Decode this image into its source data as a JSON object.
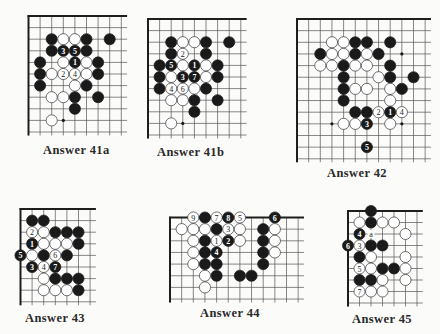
{
  "colors": {
    "background": "#fbfbf9",
    "line": "#555555",
    "edge": "#1e1e1e",
    "black_stone": "#1a1a1a",
    "white_stone": "#ffffff",
    "text": "#2a2a2a"
  },
  "boards": [
    {
      "id": "41a",
      "caption": "Answer 41a",
      "origin": [
        28.5,
        16
      ],
      "spacing": 11.6,
      "cols": 9,
      "rows": 11,
      "edges": {
        "left": true,
        "top": true
      },
      "caption_pos": [
        43,
        143
      ],
      "stones": [
        {
          "c": 2,
          "r": 2,
          "color": "B"
        },
        {
          "c": 3,
          "r": 2,
          "color": "W"
        },
        {
          "c": 4,
          "r": 2,
          "color": "W"
        },
        {
          "c": 5,
          "r": 2,
          "color": "B"
        },
        {
          "c": 7,
          "r": 2,
          "color": "B"
        },
        {
          "c": 2,
          "r": 3,
          "color": "B"
        },
        {
          "c": 3,
          "r": 3,
          "color": "B",
          "label": "3"
        },
        {
          "c": 4,
          "r": 3,
          "color": "B",
          "label": "5"
        },
        {
          "c": 5,
          "r": 3,
          "color": "B"
        },
        {
          "c": 1,
          "r": 4,
          "color": "B"
        },
        {
          "c": 3,
          "r": 4,
          "color": "W"
        },
        {
          "c": 4,
          "r": 4,
          "color": "B",
          "label": "1"
        },
        {
          "c": 5,
          "r": 4,
          "color": "W"
        },
        {
          "c": 6,
          "r": 4,
          "color": "B"
        },
        {
          "c": 1,
          "r": 5,
          "color": "B"
        },
        {
          "c": 2,
          "r": 5,
          "color": "W"
        },
        {
          "c": 3,
          "r": 5,
          "color": "W",
          "label": "2"
        },
        {
          "c": 4,
          "r": 5,
          "color": "W",
          "label": "4"
        },
        {
          "c": 5,
          "r": 5,
          "color": "W"
        },
        {
          "c": 6,
          "r": 5,
          "color": "B"
        },
        {
          "c": 1,
          "r": 6,
          "color": "B"
        },
        {
          "c": 4,
          "r": 6,
          "color": "W"
        },
        {
          "c": 5,
          "r": 6,
          "color": "B"
        },
        {
          "c": 2,
          "r": 7,
          "color": "W"
        },
        {
          "c": 3,
          "r": 7,
          "color": "W"
        },
        {
          "c": 4,
          "r": 7,
          "color": "B"
        },
        {
          "c": 6,
          "r": 7,
          "color": "B"
        },
        {
          "c": 4,
          "r": 8,
          "color": "B"
        },
        {
          "c": 2,
          "r": 9,
          "color": "W"
        }
      ],
      "hoshi": [
        {
          "c": 3,
          "r": 9
        }
      ]
    },
    {
      "id": "41b",
      "caption": "Answer 41b",
      "origin": [
        148,
        19
      ],
      "spacing": 11.6,
      "cols": 9,
      "rows": 11,
      "edges": {
        "left": true,
        "top": true
      },
      "caption_pos": [
        157,
        145
      ],
      "stones": [
        {
          "c": 2,
          "r": 2,
          "color": "B"
        },
        {
          "c": 3,
          "r": 2,
          "color": "W"
        },
        {
          "c": 4,
          "r": 2,
          "color": "W"
        },
        {
          "c": 5,
          "r": 2,
          "color": "B"
        },
        {
          "c": 7,
          "r": 2,
          "color": "B"
        },
        {
          "c": 2,
          "r": 3,
          "color": "B"
        },
        {
          "c": 3,
          "r": 3,
          "color": "W",
          "label": "2"
        },
        {
          "c": 5,
          "r": 3,
          "color": "B"
        },
        {
          "c": 1,
          "r": 4,
          "color": "B"
        },
        {
          "c": 2,
          "r": 4,
          "color": "B",
          "label": "5"
        },
        {
          "c": 3,
          "r": 4,
          "color": "W"
        },
        {
          "c": 4,
          "r": 4,
          "color": "B",
          "label": "1"
        },
        {
          "c": 5,
          "r": 4,
          "color": "W"
        },
        {
          "c": 6,
          "r": 4,
          "color": "B"
        },
        {
          "c": 1,
          "r": 5,
          "color": "B"
        },
        {
          "c": 2,
          "r": 5,
          "color": "W"
        },
        {
          "c": 3,
          "r": 5,
          "color": "B",
          "label": "3"
        },
        {
          "c": 4,
          "r": 5,
          "color": "B",
          "label": "7"
        },
        {
          "c": 5,
          "r": 5,
          "color": "W"
        },
        {
          "c": 6,
          "r": 5,
          "color": "B"
        },
        {
          "c": 1,
          "r": 6,
          "color": "B"
        },
        {
          "c": 2,
          "r": 6,
          "color": "W",
          "label": "4"
        },
        {
          "c": 3,
          "r": 6,
          "color": "W",
          "label": "6"
        },
        {
          "c": 4,
          "r": 6,
          "color": "W"
        },
        {
          "c": 5,
          "r": 6,
          "color": "B"
        },
        {
          "c": 2,
          "r": 7,
          "color": "W"
        },
        {
          "c": 3,
          "r": 7,
          "color": "W"
        },
        {
          "c": 4,
          "r": 7,
          "color": "B"
        },
        {
          "c": 6,
          "r": 7,
          "color": "B"
        },
        {
          "c": 4,
          "r": 8,
          "color": "B"
        },
        {
          "c": 2,
          "r": 9,
          "color": "W"
        }
      ],
      "hoshi": [
        {
          "c": 3,
          "r": 9
        }
      ]
    },
    {
      "id": "42",
      "caption": "Answer 42",
      "origin": [
        297,
        19
      ],
      "spacing": 11.65,
      "cols": 12,
      "rows": 13,
      "edges": {
        "left": true,
        "top": true
      },
      "caption_pos": [
        327,
        166
      ],
      "stones": [
        {
          "c": 3,
          "r": 2,
          "color": "W"
        },
        {
          "c": 4,
          "r": 2,
          "color": "W"
        },
        {
          "c": 5,
          "r": 2,
          "color": "B"
        },
        {
          "c": 6,
          "r": 2,
          "color": "B"
        },
        {
          "c": 8,
          "r": 2,
          "color": "B"
        },
        {
          "c": 2,
          "r": 3,
          "color": "B"
        },
        {
          "c": 3,
          "r": 3,
          "color": "W"
        },
        {
          "c": 4,
          "r": 3,
          "color": "W"
        },
        {
          "c": 5,
          "r": 3,
          "color": "B"
        },
        {
          "c": 6,
          "r": 3,
          "color": "W"
        },
        {
          "c": 7,
          "r": 3,
          "color": "B"
        },
        {
          "c": 2,
          "r": 4,
          "color": "W"
        },
        {
          "c": 3,
          "r": 4,
          "color": "W"
        },
        {
          "c": 4,
          "r": 4,
          "color": "B"
        },
        {
          "c": 5,
          "r": 4,
          "color": "W"
        },
        {
          "c": 6,
          "r": 4,
          "color": "W"
        },
        {
          "c": 8,
          "r": 4,
          "color": "B"
        },
        {
          "c": 4,
          "r": 5,
          "color": "B"
        },
        {
          "c": 7,
          "r": 5,
          "color": "W"
        },
        {
          "c": 8,
          "r": 5,
          "color": "B"
        },
        {
          "c": 10,
          "r": 5,
          "color": "B"
        },
        {
          "c": 4,
          "r": 6,
          "color": "B"
        },
        {
          "c": 5,
          "r": 6,
          "color": "W"
        },
        {
          "c": 6,
          "r": 6,
          "color": "W"
        },
        {
          "c": 8,
          "r": 6,
          "color": "W"
        },
        {
          "c": 9,
          "r": 6,
          "color": "B"
        },
        {
          "c": 4,
          "r": 7,
          "color": "B"
        },
        {
          "c": 8,
          "r": 7,
          "color": "W"
        },
        {
          "c": 5,
          "r": 8,
          "color": "B"
        },
        {
          "c": 6,
          "r": 8,
          "color": "B"
        },
        {
          "c": 7,
          "r": 8,
          "color": "W",
          "label": "2"
        },
        {
          "c": 8,
          "r": 8,
          "color": "B",
          "label": "1"
        },
        {
          "c": 9,
          "r": 8,
          "color": "W",
          "label": "4"
        },
        {
          "c": 4,
          "r": 9,
          "color": "W"
        },
        {
          "c": 5,
          "r": 9,
          "color": "W"
        },
        {
          "c": 6,
          "r": 9,
          "color": "B",
          "label": "3"
        },
        {
          "c": 8,
          "r": 9,
          "color": "W"
        },
        {
          "c": 6,
          "r": 11,
          "color": "B",
          "label": "5"
        }
      ],
      "hoshi": [
        {
          "c": 9,
          "r": 3
        },
        {
          "c": 3,
          "r": 9
        },
        {
          "c": 9,
          "r": 9
        }
      ]
    },
    {
      "id": "43",
      "caption": "Answer 43",
      "origin": [
        20.5,
        209
      ],
      "spacing": 11.6,
      "cols": 7,
      "rows": 9,
      "edges": {
        "left": true,
        "top": true
      },
      "caption_pos": [
        25,
        311
      ],
      "stones": [
        {
          "c": 1,
          "r": 1,
          "color": "B"
        },
        {
          "c": 2,
          "r": 1,
          "color": "B"
        },
        {
          "c": 1,
          "r": 2,
          "color": "W",
          "label": "2"
        },
        {
          "c": 2,
          "r": 2,
          "color": "W"
        },
        {
          "c": 3,
          "r": 2,
          "color": "B"
        },
        {
          "c": 4,
          "r": 2,
          "color": "B"
        },
        {
          "c": 5,
          "r": 2,
          "color": "B"
        },
        {
          "c": 1,
          "r": 3,
          "color": "B",
          "label": "1"
        },
        {
          "c": 2,
          "r": 3,
          "color": "W"
        },
        {
          "c": 3,
          "r": 3,
          "color": "W"
        },
        {
          "c": 4,
          "r": 3,
          "color": "W"
        },
        {
          "c": 5,
          "r": 3,
          "color": "B"
        },
        {
          "c": 0,
          "r": 4,
          "color": "B",
          "label": "5"
        },
        {
          "c": 1,
          "r": 4,
          "color": "W"
        },
        {
          "c": 2,
          "r": 4,
          "color": "B"
        },
        {
          "c": 3,
          "r": 4,
          "color": "W",
          "label": "6"
        },
        {
          "c": 4,
          "r": 4,
          "color": "B"
        },
        {
          "c": 1,
          "r": 5,
          "color": "B",
          "label": "3"
        },
        {
          "c": 2,
          "r": 5,
          "color": "W",
          "label": "4"
        },
        {
          "c": 3,
          "r": 5,
          "color": "B",
          "label": "7"
        },
        {
          "c": 2,
          "r": 6,
          "color": "W"
        },
        {
          "c": 3,
          "r": 6,
          "color": "B"
        },
        {
          "c": 4,
          "r": 6,
          "color": "B"
        },
        {
          "c": 5,
          "r": 6,
          "color": "B"
        },
        {
          "c": 2,
          "r": 7,
          "color": "W"
        },
        {
          "c": 3,
          "r": 7,
          "color": "W"
        },
        {
          "c": 4,
          "r": 7,
          "color": "W"
        },
        {
          "c": 5,
          "r": 7,
          "color": "B"
        }
      ],
      "hoshi": []
    },
    {
      "id": "44",
      "caption": "Answer 44",
      "origin": [
        170,
        217.5
      ],
      "spacing": 11.65,
      "cols": 12,
      "rows": 8,
      "edges": {
        "left": true,
        "top": true
      },
      "caption_pos": [
        200,
        306
      ],
      "stones": [
        {
          "c": 2,
          "r": 0,
          "color": "W",
          "label": "9"
        },
        {
          "c": 3,
          "r": 0,
          "color": "B"
        },
        {
          "c": 4,
          "r": 0,
          "color": "W",
          "label": "7"
        },
        {
          "c": 5,
          "r": 0,
          "color": "B",
          "label": "8"
        },
        {
          "c": 6,
          "r": 0,
          "color": "W",
          "label": "5"
        },
        {
          "c": 9,
          "r": 0,
          "color": "B",
          "label": "6"
        },
        {
          "c": 1,
          "r": 1,
          "color": "W"
        },
        {
          "c": 2,
          "r": 1,
          "color": "W"
        },
        {
          "c": 3,
          "r": 1,
          "color": "W"
        },
        {
          "c": 4,
          "r": 1,
          "color": "B"
        },
        {
          "c": 5,
          "r": 1,
          "color": "W",
          "label": "3"
        },
        {
          "c": 6,
          "r": 1,
          "color": "W"
        },
        {
          "c": 8,
          "r": 1,
          "color": "B"
        },
        {
          "c": 9,
          "r": 1,
          "color": "W"
        },
        {
          "c": 2,
          "r": 2,
          "color": "W"
        },
        {
          "c": 3,
          "r": 2,
          "color": "B"
        },
        {
          "c": 4,
          "r": 2,
          "color": "W",
          "label": "1"
        },
        {
          "c": 5,
          "r": 2,
          "color": "B",
          "label": "2"
        },
        {
          "c": 6,
          "r": 2,
          "color": "W"
        },
        {
          "c": 8,
          "r": 2,
          "color": "B"
        },
        {
          "c": 9,
          "r": 2,
          "color": "W"
        },
        {
          "c": 2,
          "r": 3,
          "color": "W"
        },
        {
          "c": 3,
          "r": 3,
          "color": "B"
        },
        {
          "c": 4,
          "r": 3,
          "color": "B",
          "label": "4"
        },
        {
          "c": 8,
          "r": 3,
          "color": "B"
        },
        {
          "c": 9,
          "r": 3,
          "color": "W"
        },
        {
          "c": 2,
          "r": 4,
          "color": "W"
        },
        {
          "c": 3,
          "r": 4,
          "color": "B"
        },
        {
          "c": 4,
          "r": 4,
          "color": "B"
        },
        {
          "c": 8,
          "r": 4,
          "color": "B"
        },
        {
          "c": 3,
          "r": 5,
          "color": "W"
        },
        {
          "c": 4,
          "r": 5,
          "color": "B"
        },
        {
          "c": 6,
          "r": 5,
          "color": "B"
        },
        {
          "c": 7,
          "r": 5,
          "color": "B"
        },
        {
          "c": 3,
          "r": 6,
          "color": "W"
        }
      ],
      "hoshi": []
    },
    {
      "id": "45",
      "caption": "Answer 45",
      "origin": [
        348,
        211
      ],
      "spacing": 11.5,
      "cols": 7,
      "rows": 9,
      "edges": {
        "left": true,
        "top": true
      },
      "caption_pos": [
        352,
        312
      ],
      "stones": [
        {
          "c": 2,
          "r": 0,
          "color": "B"
        },
        {
          "c": 1,
          "r": 1,
          "color": "W"
        },
        {
          "c": 2,
          "r": 1,
          "color": "B"
        },
        {
          "c": 3,
          "r": 1,
          "color": "W"
        },
        {
          "c": 4,
          "r": 1,
          "color": "W"
        },
        {
          "c": 1,
          "r": 2,
          "color": "B",
          "label": "4"
        },
        {
          "c": 5,
          "r": 2,
          "color": "W"
        },
        {
          "c": 0,
          "r": 3,
          "color": "B",
          "label": "6"
        },
        {
          "c": 1,
          "r": 3,
          "color": "W",
          "label": "3"
        },
        {
          "c": 2,
          "r": 3,
          "color": "B"
        },
        {
          "c": 3,
          "r": 3,
          "color": "B"
        },
        {
          "c": 1,
          "r": 4,
          "color": "B"
        },
        {
          "c": 2,
          "r": 4,
          "color": "W"
        },
        {
          "c": 5,
          "r": 4,
          "color": "W"
        },
        {
          "c": 1,
          "r": 5,
          "color": "W",
          "label": "5"
        },
        {
          "c": 2,
          "r": 5,
          "color": "W"
        },
        {
          "c": 3,
          "r": 5,
          "color": "B"
        },
        {
          "c": 4,
          "r": 5,
          "color": "B"
        },
        {
          "c": 5,
          "r": 5,
          "color": "W"
        },
        {
          "c": 1,
          "r": 6,
          "color": "B"
        },
        {
          "c": 2,
          "r": 6,
          "color": "B"
        },
        {
          "c": 3,
          "r": 6,
          "color": "W"
        },
        {
          "c": 5,
          "r": 6,
          "color": "W"
        },
        {
          "c": 1,
          "r": 7,
          "color": "W",
          "label": "7"
        },
        {
          "c": 2,
          "r": 7,
          "color": "W"
        },
        {
          "c": 3,
          "r": 7,
          "color": "W"
        }
      ],
      "marks": [
        {
          "c": 2,
          "r": 2,
          "label": "a"
        }
      ],
      "hoshi": []
    }
  ]
}
